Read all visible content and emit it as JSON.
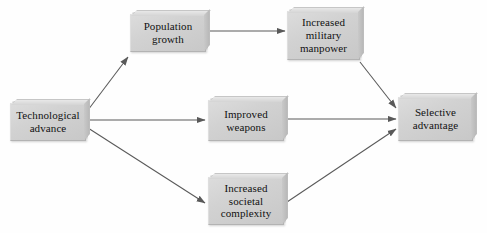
{
  "diagram": {
    "background_color": "#fefefe",
    "node_fill_color": "#d2d2d2",
    "node_border_color": "#b3b3b3",
    "arrow_color": "#595959",
    "text_color": "#111111",
    "nodes": [
      {
        "id": "technological-advance",
        "label": "Technological\nadvance",
        "x": 10,
        "y": 103,
        "width": 76,
        "height": 38
      },
      {
        "id": "population-growth",
        "label": "Population\ngrowth",
        "x": 130,
        "y": 14,
        "width": 76,
        "height": 38
      },
      {
        "id": "increased-military-manpower",
        "label": "Increased\nmilitary\nmanpower",
        "x": 287,
        "y": 11,
        "width": 73,
        "height": 49
      },
      {
        "id": "improved-weapons",
        "label": "Improved\nweapons",
        "x": 208,
        "y": 100,
        "width": 76,
        "height": 41
      },
      {
        "id": "increased-societal-complexity",
        "label": "Increased\nsocietal\ncomplexity",
        "x": 208,
        "y": 177,
        "width": 76,
        "height": 48
      },
      {
        "id": "selective-advantage",
        "label": "Selective\nadvantage",
        "x": 398,
        "y": 97,
        "width": 75,
        "height": 44
      }
    ],
    "edges": [
      {
        "id": "edge-tech-to-population",
        "from": "technological-advance",
        "to": "population-growth",
        "x1": 88,
        "y1": 110,
        "x2": 128,
        "y2": 57
      },
      {
        "id": "edge-tech-to-weapons",
        "from": "technological-advance",
        "to": "improved-weapons",
        "x1": 88,
        "y1": 120,
        "x2": 205,
        "y2": 120
      },
      {
        "id": "edge-tech-to-complexity",
        "from": "technological-advance",
        "to": "increased-societal-complexity",
        "x1": 88,
        "y1": 128,
        "x2": 205,
        "y2": 203
      },
      {
        "id": "edge-population-to-manpower",
        "from": "population-growth",
        "to": "increased-military-manpower",
        "x1": 208,
        "y1": 31,
        "x2": 285,
        "y2": 31
      },
      {
        "id": "edge-manpower-to-selective",
        "from": "increased-military-manpower",
        "to": "selective-advantage",
        "x1": 360,
        "y1": 62,
        "x2": 396,
        "y2": 108
      },
      {
        "id": "edge-weapons-to-selective",
        "from": "improved-weapons",
        "to": "selective-advantage",
        "x1": 287,
        "y1": 119,
        "x2": 396,
        "y2": 119
      },
      {
        "id": "edge-complexity-to-selective",
        "from": "increased-societal-complexity",
        "to": "selective-advantage",
        "x1": 287,
        "y1": 202,
        "x2": 396,
        "y2": 129
      }
    ]
  }
}
